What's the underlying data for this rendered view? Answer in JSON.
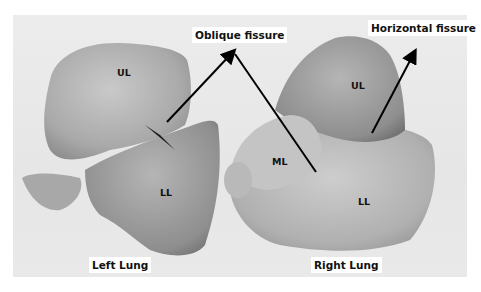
{
  "figure": {
    "background_color": "#ececec",
    "annotations": {
      "oblique_fissure": "Oblique fissure",
      "horizontal_fissure": "Horizontal fissure"
    },
    "left_lung": {
      "caption": "Left Lung",
      "lobes": {
        "upper": "UL",
        "lower": "LL"
      }
    },
    "right_lung": {
      "caption": "Right Lung",
      "lobes": {
        "upper": "UL",
        "middle": "ML",
        "lower": "LL"
      }
    },
    "arrow_color": "#000000"
  }
}
